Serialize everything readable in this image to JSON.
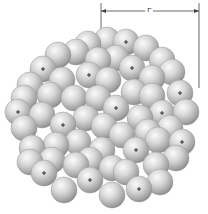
{
  "figure": {
    "radius_label": "r",
    "nucleon_radius": 13,
    "colors": {
      "nucleon_light": "#f4f4f4",
      "nucleon_mid": "#c8c8c8",
      "nucleon_dark": "#8a8a8a",
      "outline": "#9a9a9a",
      "line": "#444444",
      "plus": "#222222"
    },
    "dimension": {
      "x1": 101,
      "x2": 199,
      "y": 11,
      "tick_top": 3,
      "left_tick_bottom": 34,
      "right_tick_bottom": 88
    },
    "protons": [
      [
        126,
        42
      ],
      [
        43,
        69
      ],
      [
        89,
        75
      ],
      [
        132,
        68
      ],
      [
        180,
        93
      ],
      [
        116,
        108
      ],
      [
        18,
        112
      ],
      [
        162,
        113
      ],
      [
        63,
        125
      ],
      [
        182,
        142
      ],
      [
        136,
        150
      ],
      [
        44,
        173
      ],
      [
        90,
        180
      ],
      [
        139,
        189
      ]
    ],
    "neutrons": [
      [
        88,
        44
      ],
      [
        107,
        40
      ],
      [
        146,
        48
      ],
      [
        58,
        55
      ],
      [
        76,
        52
      ],
      [
        162,
        60
      ],
      [
        98,
        60
      ],
      [
        116,
        58
      ],
      [
        30,
        85
      ],
      [
        62,
        80
      ],
      [
        108,
        80
      ],
      [
        152,
        78
      ],
      [
        172,
        72
      ],
      [
        186,
        112
      ],
      [
        24,
        98
      ],
      [
        50,
        95
      ],
      [
        74,
        98
      ],
      [
        98,
        98
      ],
      [
        134,
        92
      ],
      [
        152,
        96
      ],
      [
        24,
        128
      ],
      [
        42,
        115
      ],
      [
        86,
        118
      ],
      [
        104,
        126
      ],
      [
        140,
        118
      ],
      [
        170,
        128
      ],
      [
        32,
        148
      ],
      [
        56,
        145
      ],
      [
        78,
        142
      ],
      [
        102,
        150
      ],
      [
        122,
        135
      ],
      [
        158,
        140
      ],
      [
        176,
        158
      ],
      [
        52,
        160
      ],
      [
        76,
        165
      ],
      [
        112,
        168
      ],
      [
        156,
        165
      ],
      [
        30,
        162
      ],
      [
        64,
        190
      ],
      [
        112,
        195
      ],
      [
        160,
        182
      ],
      [
        90,
        160
      ],
      [
        126,
        172
      ],
      [
        148,
        132
      ]
    ]
  }
}
